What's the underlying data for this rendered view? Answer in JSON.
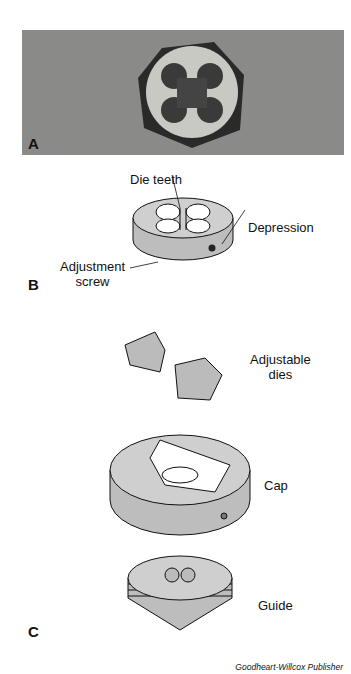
{
  "figure": {
    "panels": [
      {
        "letter": "A",
        "description": "Photo of hexagonal threading die, 7/8-14 NC",
        "die_marks": [
          "7/8",
          "14",
          "NC"
        ]
      },
      {
        "letter": "B",
        "labels": {
          "die_teeth": "Die teeth",
          "depression": "Depression",
          "adjustment_screw_line1": "Adjustment",
          "adjustment_screw_line2": "screw"
        }
      },
      {
        "letter": "C",
        "labels": {
          "adjustable_dies_line1": "Adjustable",
          "adjustable_dies_line2": "dies",
          "cap": "Cap",
          "guide": "Guide"
        }
      }
    ],
    "credit": "Goodheart-Willcox Publisher"
  },
  "colors": {
    "photo_bg": "#8a8a88",
    "part_fill": "#c8c8c8",
    "outline": "#111111"
  }
}
